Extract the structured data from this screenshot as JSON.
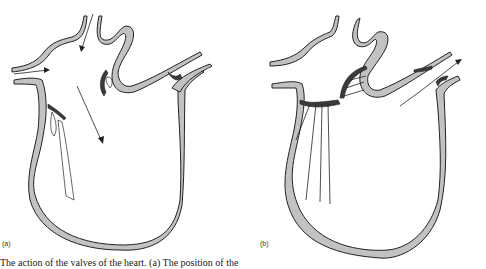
{
  "figure": {
    "panels": [
      {
        "id": "a",
        "label": "(a)",
        "description": "Heart in diastole: atrioventricular valves open, semilunar valves closed; arrows show blood entering atrium and flowing into ventricle"
      },
      {
        "id": "b",
        "label": "(b)",
        "description": "Heart in systole: atrioventricular valves closed, semilunar valves open; arrow shows blood leaving through artery"
      }
    ],
    "caption": "The action of the valves of the heart. (a) The position of the"
  },
  "colors": {
    "wall_fill": "#c2c2c2",
    "outline": "#222222",
    "valve_dark": "#3a3a3a",
    "background": "#ffffff"
  }
}
